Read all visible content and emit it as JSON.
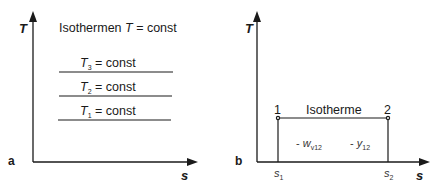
{
  "panel_a": {
    "label": "a",
    "axis_y_label": "T",
    "axis_x_label": "s",
    "title_prefix": "Isothermen ",
    "title_var": "T",
    "title_suffix": " = const",
    "isotherms": [
      {
        "var": "T",
        "sub": "3",
        "text": " = const"
      },
      {
        "var": "T",
        "sub": "2",
        "text": " = const"
      },
      {
        "var": "T",
        "sub": "1",
        "text": " = const"
      }
    ]
  },
  "panel_b": {
    "label": "b",
    "axis_y_label": "T",
    "axis_x_label": "s",
    "isotherm_label": "Isotherme",
    "point_1": "1",
    "point_2": "2",
    "s1": {
      "var": "s",
      "sub": "1"
    },
    "s2": {
      "var": "s",
      "sub": "2"
    },
    "work_label": {
      "prefix": "- ",
      "var": "w",
      "sub": "v12"
    },
    "y_label": {
      "prefix": "- ",
      "var": "y",
      "sub": "12"
    }
  },
  "colors": {
    "line": "#1a1a1a",
    "background": "#ffffff"
  }
}
